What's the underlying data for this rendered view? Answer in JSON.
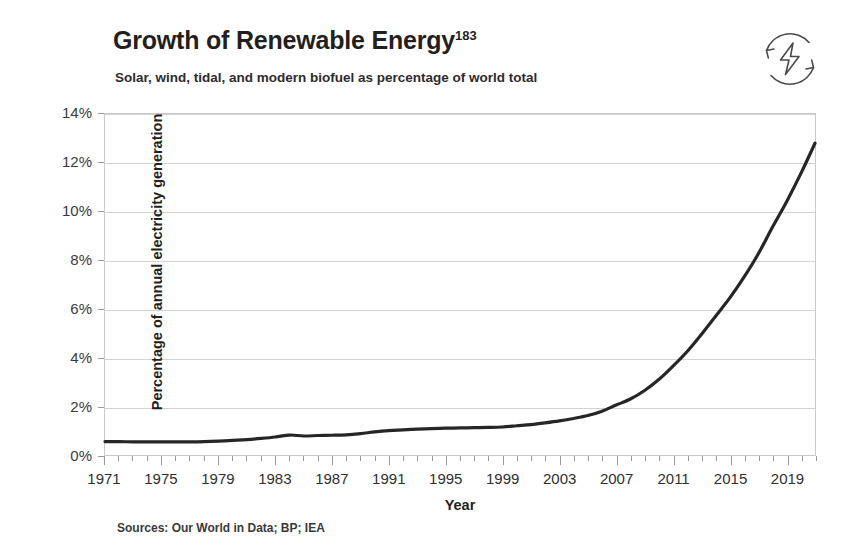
{
  "header": {
    "title": "Growth of Renewable Energy",
    "title_superscript": "183",
    "subtitle": "Solar, wind, tidal, and modern biofuel as percentage of world total",
    "icon_name": "renewable-energy-icon"
  },
  "footer": {
    "sources": "Sources: Our World in Data; BP; IEA"
  },
  "style": {
    "line_color": "#262626",
    "gridline_color": "#d2d2d2",
    "axis_color": "#c9c9c9",
    "text_color": "#231f20",
    "background": "#ffffff"
  },
  "chart_data": {
    "type": "line",
    "title": "Growth of Renewable Energy",
    "subtitle": "Solar, wind, tidal, and modern biofuel as percentage of world total",
    "xlabel": "Year",
    "ylabel": "Percentage of annual electricity generation",
    "xlim": [
      1971,
      2021
    ],
    "ylim": [
      0,
      14
    ],
    "y_tick_labels": [
      "0%",
      "2%",
      "4%",
      "6%",
      "8%",
      "10%",
      "12%",
      "14%"
    ],
    "y_ticks": [
      0,
      2,
      4,
      6,
      8,
      10,
      12,
      14
    ],
    "x_tick_labels": [
      "1971",
      "1975",
      "1979",
      "1983",
      "1987",
      "1991",
      "1995",
      "1999",
      "2003",
      "2007",
      "2011",
      "2015",
      "2019"
    ],
    "x_major_ticks": [
      1971,
      1975,
      1979,
      1983,
      1987,
      1991,
      1995,
      1999,
      2003,
      2007,
      2011,
      2015,
      2019
    ],
    "x_minor_tick_step": 1,
    "grid": "horizontal",
    "legend": "none",
    "units": "percent",
    "series": [
      {
        "name": "Renewables share of electricity generation",
        "x": [
          1971,
          1972,
          1973,
          1974,
          1975,
          1976,
          1977,
          1978,
          1979,
          1980,
          1981,
          1982,
          1983,
          1984,
          1985,
          1986,
          1987,
          1988,
          1989,
          1990,
          1991,
          1992,
          1993,
          1994,
          1995,
          1996,
          1997,
          1998,
          1999,
          2000,
          2001,
          2002,
          2003,
          2004,
          2005,
          2006,
          2007,
          2008,
          2009,
          2010,
          2011,
          2012,
          2013,
          2014,
          2015,
          2016,
          2017,
          2018,
          2019,
          2020,
          2021
        ],
        "values": [
          0.55,
          0.55,
          0.54,
          0.54,
          0.54,
          0.54,
          0.54,
          0.55,
          0.57,
          0.6,
          0.63,
          0.68,
          0.74,
          0.82,
          0.78,
          0.8,
          0.81,
          0.83,
          0.88,
          0.95,
          1.0,
          1.03,
          1.06,
          1.08,
          1.1,
          1.11,
          1.12,
          1.13,
          1.15,
          1.2,
          1.25,
          1.32,
          1.4,
          1.5,
          1.62,
          1.8,
          2.05,
          2.3,
          2.65,
          3.1,
          3.65,
          4.25,
          4.95,
          5.7,
          6.45,
          7.3,
          8.25,
          9.35,
          10.4,
          11.55,
          12.8
        ]
      }
    ]
  }
}
